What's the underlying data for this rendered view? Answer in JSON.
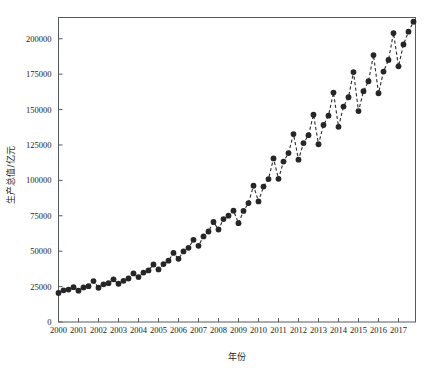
{
  "chart_data": {
    "type": "line",
    "title": "",
    "xlabel": "年份",
    "ylabel": "生产总值/亿元",
    "grid": false,
    "legend": "none",
    "marker": "filled-circle",
    "linestyle": "dashed",
    "color": "#262626",
    "xlim": [
      2000.0,
      2017.85
    ],
    "ylim": [
      0,
      215000
    ],
    "xticks": [
      "2000",
      "2001",
      "2002",
      "2003",
      "2004",
      "2005",
      "2006",
      "2007",
      "2008",
      "2009",
      "2010",
      "2011",
      "2012",
      "2013",
      "2014",
      "2015",
      "2016",
      "2017"
    ],
    "xtick_values": [
      2000,
      2001,
      2002,
      2003,
      2004,
      2005,
      2006,
      2007,
      2008,
      2009,
      2010,
      2011,
      2012,
      2013,
      2014,
      2015,
      2016,
      2017
    ],
    "yticks": [
      "0",
      "25000",
      "50000",
      "75000",
      "100000",
      "125000",
      "150000",
      "175000",
      "200000"
    ],
    "ytick_values": [
      0,
      25000,
      50000,
      75000,
      100000,
      125000,
      150000,
      175000,
      200000
    ],
    "x_note": "quarterly observations, 4 per year (Q1..Q4)",
    "x": [
      2000.0,
      2000.25,
      2000.5,
      2000.75,
      2001.0,
      2001.25,
      2001.5,
      2001.75,
      2002.0,
      2002.25,
      2002.5,
      2002.75,
      2003.0,
      2003.25,
      2003.5,
      2003.75,
      2004.0,
      2004.25,
      2004.5,
      2004.75,
      2005.0,
      2005.25,
      2005.5,
      2005.75,
      2006.0,
      2006.25,
      2006.5,
      2006.75,
      2007.0,
      2007.25,
      2007.5,
      2007.75,
      2008.0,
      2008.25,
      2008.5,
      2008.75,
      2009.0,
      2009.25,
      2009.5,
      2009.75,
      2010.0,
      2010.25,
      2010.5,
      2010.75,
      2011.0,
      2011.25,
      2011.5,
      2011.75,
      2012.0,
      2012.25,
      2012.5,
      2012.75,
      2013.0,
      2013.25,
      2013.5,
      2013.75,
      2014.0,
      2014.25,
      2014.5,
      2014.75,
      2015.0,
      2015.25,
      2015.5,
      2015.75,
      2016.0,
      2016.25,
      2016.5,
      2016.75,
      2017.0,
      2017.25,
      2017.5,
      2017.75
    ],
    "values": [
      20500,
      22400,
      22900,
      24600,
      22100,
      24400,
      25300,
      28900,
      24200,
      26600,
      27400,
      30100,
      27000,
      29100,
      30700,
      34300,
      31700,
      34900,
      36400,
      40600,
      37100,
      40900,
      43300,
      48800,
      44600,
      49800,
      52400,
      58000,
      53800,
      60400,
      63900,
      70600,
      65300,
      72700,
      75100,
      78600,
      69800,
      78400,
      84000,
      96200,
      85100,
      95600,
      100900,
      115500,
      101100,
      113300,
      119300,
      132700,
      114600,
      126300,
      131900,
      146400,
      125500,
      139100,
      145700,
      162000,
      137800,
      152100,
      158700,
      176500,
      148900,
      163000,
      170000,
      188500,
      161500,
      176800,
      185000,
      204000,
      180500,
      196000,
      205000,
      212000
    ]
  }
}
